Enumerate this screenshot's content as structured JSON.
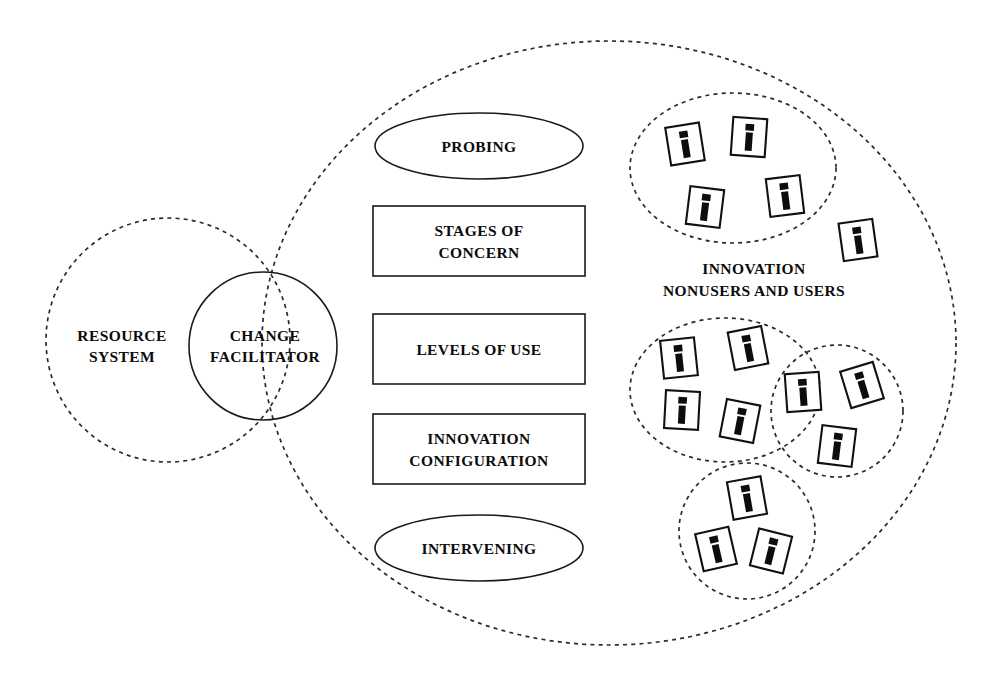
{
  "diagram": {
    "colors": {
      "stroke": "#1a1a1a",
      "dashed_stroke": "#2b2b2b",
      "text": "#0b0b0b",
      "background": "#ffffff"
    },
    "nodes": {
      "resource_system": {
        "label_line1": "RESOURCE",
        "label_line2": "SYSTEM"
      },
      "change_facilitator": {
        "label_line1": "CHANGE",
        "label_line2": "FACILITATOR"
      },
      "probing": {
        "label": "PROBING"
      },
      "stages_of_concern": {
        "label_line1": "STAGES OF",
        "label_line2": "CONCERN"
      },
      "levels_of_use": {
        "label": "LEVELS OF USE"
      },
      "innovation_configuration": {
        "label_line1": "INNOVATION",
        "label_line2": "CONFIGURATION"
      },
      "intervening": {
        "label": "INTERVENING"
      },
      "innovation_users_group": {
        "label_line1": "INNOVATION",
        "label_line2": "NONUSERS AND USERS"
      }
    },
    "icons": {
      "person_icon_name": "individual-innovation-user-icon",
      "top_cluster_count": 4,
      "outside_top_cluster_count": 1,
      "left_lower_cluster_count": 5,
      "right_lower_cluster_count": 3,
      "bottom_cluster_count": 3,
      "shared_between_clusters_count": 1,
      "total_count": 16
    },
    "shapes": {
      "outer_boundary": "large dashed ellipse",
      "resource_system_boundary": "dashed circle",
      "change_facilitator_boundary": "solid circle",
      "cluster_boundaries": "dashed ellipses and circles"
    }
  }
}
